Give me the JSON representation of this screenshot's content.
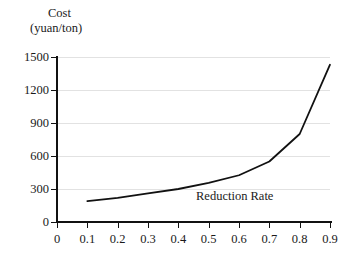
{
  "chart_data": {
    "type": "line",
    "title": "",
    "ylabel": "Cost",
    "ylabel_units": "(yuan/ton)",
    "xlabel": "",
    "annotation": "Reduction Rate",
    "x": [
      0.1,
      0.2,
      0.3,
      0.4,
      0.5,
      0.6,
      0.7,
      0.8,
      0.9
    ],
    "values": [
      190,
      220,
      260,
      300,
      355,
      425,
      550,
      800,
      1430
    ],
    "series": [
      {
        "name": "Cost",
        "values": [
          190,
          220,
          260,
          300,
          355,
          425,
          550,
          800,
          1430
        ],
        "color": "#111111"
      }
    ],
    "xlim": [
      0,
      0.9
    ],
    "ylim": [
      0,
      1500
    ],
    "xticks": [
      0,
      0.1,
      0.2,
      0.3,
      0.4,
      0.5,
      0.6,
      0.7,
      0.8,
      0.9
    ],
    "xtick_labels": [
      "0",
      "0.1",
      "0.2",
      "0.3",
      "0.4",
      "0.5",
      "0.6",
      "0.7",
      "0.8",
      "0.9"
    ],
    "yticks": [
      0,
      300,
      600,
      900,
      1200,
      1500
    ],
    "ytick_labels": [
      "0",
      "300",
      "600",
      "900",
      "1200",
      "1500"
    ],
    "grid": true,
    "grid_axis": "y",
    "grid_color": "#e2e2e2",
    "legend": false,
    "background": "#ffffff",
    "axis_color": "#111111"
  }
}
